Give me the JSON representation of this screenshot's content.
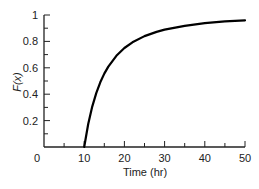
{
  "chart_data": {
    "type": "line",
    "title": "",
    "xlabel": "Time (hr)",
    "ylabel": "F(x)",
    "xlim": [
      0,
      50
    ],
    "ylim": [
      0,
      1
    ],
    "grid": false,
    "legend": null,
    "x_ticks": [
      0,
      10,
      20,
      30,
      40,
      50
    ],
    "x_tick_labels": [
      "0",
      "10",
      "20",
      "30",
      "40",
      "50"
    ],
    "x_minor_ticks": [
      5,
      15,
      25,
      35,
      45
    ],
    "y_ticks": [
      0.2,
      0.4,
      0.6,
      0.8,
      1
    ],
    "y_tick_labels": [
      "0.2",
      "0.4",
      "0.6",
      "0.8",
      "1"
    ],
    "y_minor_ticks": [
      0.1,
      0.3,
      0.5,
      0.7,
      0.9
    ],
    "series": [
      {
        "name": "F(x)",
        "color": "#000000",
        "x": [
          10,
          11,
          12,
          13,
          14,
          15,
          16,
          18,
          20,
          22,
          25,
          28,
          30,
          35,
          40,
          45,
          50
        ],
        "values": [
          0,
          0.174,
          0.306,
          0.408,
          0.49,
          0.556,
          0.609,
          0.691,
          0.75,
          0.793,
          0.84,
          0.872,
          0.889,
          0.918,
          0.938,
          0.951,
          0.96
        ]
      }
    ]
  }
}
